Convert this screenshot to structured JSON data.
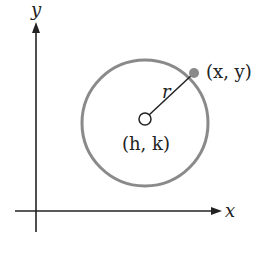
{
  "diagram": {
    "axes": {
      "x_label": "x",
      "y_label": "y"
    },
    "circle": {
      "center_label": "(h, k)",
      "point_label": "(x, y)",
      "radius_label": "r"
    },
    "colors": {
      "circle": "#8a8a8a",
      "point": "#8a8a8a",
      "axis": "#222222"
    }
  }
}
